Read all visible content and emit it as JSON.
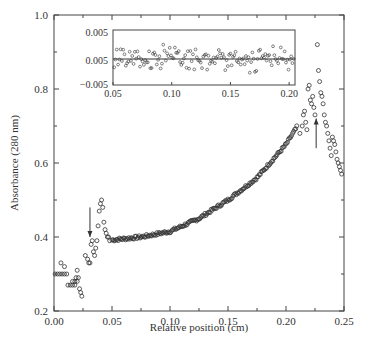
{
  "chart_data": {
    "type": "scatter",
    "title": "",
    "xlabel": "Relative position (cm)",
    "ylabel": "Absorbance (280 nm)",
    "xlim": [
      0.0,
      0.25
    ],
    "ylim": [
      0.2,
      1.0
    ],
    "grid": false,
    "legend": null,
    "xticks": [
      "0.00",
      "0.05",
      "0.10",
      "0.15",
      "0.20",
      "0.25"
    ],
    "yticks": [
      "0.2",
      "0.4",
      "0.6",
      "0.8",
      "1.0"
    ],
    "series": [
      {
        "name": "Absorbance profile",
        "marker": "open-circle",
        "x": [
          0.001,
          0.003,
          0.005,
          0.007,
          0.009,
          0.011,
          0.006,
          0.009,
          0.012,
          0.014,
          0.016,
          0.018,
          0.019,
          0.02,
          0.021,
          0.022,
          0.023,
          0.024,
          0.016,
          0.018,
          0.02,
          0.027,
          0.029,
          0.03,
          0.031,
          0.032,
          0.033,
          0.034,
          0.035,
          0.036,
          0.037,
          0.038,
          0.039,
          0.04,
          0.041,
          0.042,
          0.043,
          0.044,
          0.045,
          0.046,
          0.047,
          0.048
        ],
        "y": [
          0.3,
          0.3,
          0.3,
          0.3,
          0.3,
          0.3,
          0.33,
          0.32,
          0.27,
          0.27,
          0.28,
          0.28,
          0.29,
          0.31,
          0.29,
          0.26,
          0.25,
          0.24,
          0.27,
          0.27,
          0.28,
          0.35,
          0.34,
          0.33,
          0.33,
          0.38,
          0.39,
          0.36,
          0.35,
          0.37,
          0.39,
          0.43,
          0.47,
          0.49,
          0.5,
          0.48,
          0.44,
          0.42,
          0.41,
          0.4,
          0.4,
          0.39
        ]
      },
      {
        "name": "Curve segment",
        "marker": "open-circle",
        "x_range": [
          0.05,
          0.21
        ],
        "anchor_points": [
          [
            0.05,
            0.392
          ],
          [
            0.075,
            0.4
          ],
          [
            0.1,
            0.415
          ],
          [
            0.125,
            0.45
          ],
          [
            0.15,
            0.5
          ],
          [
            0.175,
            0.56
          ],
          [
            0.2,
            0.65
          ],
          [
            0.21,
            0.7
          ]
        ]
      },
      {
        "name": "Right peak region",
        "marker": "open-circle",
        "x": [
          0.212,
          0.214,
          0.215,
          0.216,
          0.217,
          0.218,
          0.219,
          0.22,
          0.221,
          0.222,
          0.223,
          0.224,
          0.225,
          0.227,
          0.228,
          0.229,
          0.23,
          0.231,
          0.232,
          0.233,
          0.234,
          0.235,
          0.236,
          0.237,
          0.238,
          0.239,
          0.24,
          0.241,
          0.242,
          0.243,
          0.244,
          0.245,
          0.246,
          0.247,
          0.248
        ],
        "y": [
          0.68,
          0.7,
          0.73,
          0.74,
          0.71,
          0.69,
          0.8,
          0.81,
          0.77,
          0.76,
          0.78,
          0.75,
          0.73,
          0.92,
          0.85,
          0.82,
          0.79,
          0.78,
          0.76,
          0.73,
          0.71,
          0.7,
          0.68,
          0.66,
          0.64,
          0.62,
          0.67,
          0.66,
          0.65,
          0.63,
          0.61,
          0.6,
          0.59,
          0.58,
          0.57
        ]
      }
    ],
    "annotations": [
      {
        "type": "arrow",
        "direction": "down",
        "x": 0.031,
        "y_from": 0.48,
        "y_to": 0.4
      },
      {
        "type": "arrow",
        "direction": "up",
        "x": 0.226,
        "y_from": 0.64,
        "y_to": 0.72
      }
    ],
    "inset": {
      "type": "scatter",
      "xlim": [
        0.05,
        0.205
      ],
      "xticks": [
        "0.05",
        "0.10",
        "0.15",
        "0.20"
      ],
      "yticks": [
        "0.005",
        "0.005",
        "−0.005"
      ],
      "reference_line": 0.0,
      "description": "Residuals scattered around a horizontal line, ranging roughly -0.005 to 0.005"
    }
  }
}
